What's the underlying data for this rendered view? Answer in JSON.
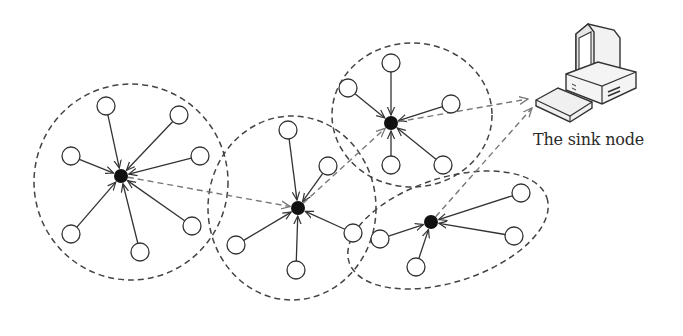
{
  "diagram": {
    "type": "wireless-sensor-network-clustering",
    "sink": {
      "label": "The sink node",
      "icon": "desktop-computer-icon",
      "x": 588,
      "y": 72
    },
    "colors": {
      "stroke": "#333333",
      "dashed_cluster": "#444444",
      "dashed_route": "#777777",
      "cluster_head": "#111111",
      "node_fill": "#ffffff"
    },
    "clusters": [
      {
        "id": "cluster-1",
        "boundary": {
          "shape": "circle",
          "cx": 131,
          "cy": 182,
          "rx": 97,
          "ry": 98,
          "rotate": 0
        },
        "head": {
          "x": 121,
          "y": 176
        },
        "members": [
          {
            "x": 106,
            "y": 106
          },
          {
            "x": 179,
            "y": 115
          },
          {
            "x": 71,
            "y": 156
          },
          {
            "x": 200,
            "y": 156
          },
          {
            "x": 71,
            "y": 234
          },
          {
            "x": 192,
            "y": 226
          },
          {
            "x": 140,
            "y": 252
          }
        ]
      },
      {
        "id": "cluster-2",
        "boundary": {
          "shape": "ellipse",
          "cx": 292,
          "cy": 208,
          "rx": 84,
          "ry": 92,
          "rotate": 0
        },
        "head": {
          "x": 298,
          "y": 208
        },
        "members": [
          {
            "x": 288,
            "y": 130
          },
          {
            "x": 328,
            "y": 166
          },
          {
            "x": 236,
            "y": 245
          },
          {
            "x": 353,
            "y": 233
          },
          {
            "x": 296,
            "y": 270
          }
        ]
      },
      {
        "id": "cluster-3",
        "boundary": {
          "shape": "ellipse",
          "cx": 412,
          "cy": 115,
          "rx": 80,
          "ry": 72,
          "rotate": 0
        },
        "head": {
          "x": 391,
          "y": 123
        },
        "members": [
          {
            "x": 391,
            "y": 63
          },
          {
            "x": 348,
            "y": 88
          },
          {
            "x": 451,
            "y": 104
          },
          {
            "x": 391,
            "y": 165
          },
          {
            "x": 443,
            "y": 165
          }
        ]
      },
      {
        "id": "cluster-4",
        "boundary": {
          "shape": "ellipse",
          "cx": 448,
          "cy": 230,
          "rx": 104,
          "ry": 52,
          "rotate": -18
        },
        "head": {
          "x": 431,
          "y": 222
        },
        "members": [
          {
            "x": 521,
            "y": 193
          },
          {
            "x": 380,
            "y": 239
          },
          {
            "x": 514,
            "y": 236
          },
          {
            "x": 416,
            "y": 267
          }
        ]
      }
    ],
    "routes": [
      {
        "from": [
          121,
          176
        ],
        "to": [
          298,
          208
        ]
      },
      {
        "from": [
          298,
          208
        ],
        "to": [
          391,
          123
        ]
      },
      {
        "from": [
          391,
          123
        ],
        "to": [
          528,
          99
        ]
      },
      {
        "from": [
          431,
          222
        ],
        "to": [
          532,
          108
        ]
      }
    ]
  }
}
